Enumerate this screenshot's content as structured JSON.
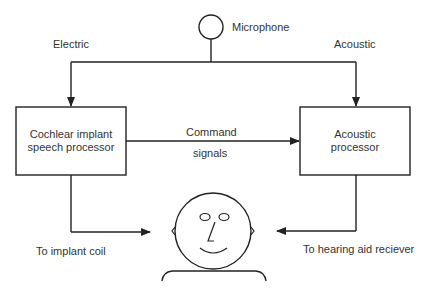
{
  "diagram": {
    "microphone": {
      "label": "Microphone"
    },
    "paths": {
      "electric_label": "Electric",
      "acoustic_label": "Acoustic",
      "command_label_line1": "Command",
      "command_label_line2": "signals"
    },
    "boxes": {
      "left": {
        "line1": "Cochlear implant",
        "line2": "speech processor"
      },
      "right": {
        "line1": "Acoustic",
        "line2": "processor"
      }
    },
    "outputs": {
      "left_label": "To implant coil",
      "right_label": "To hearing aid reciever"
    },
    "colors": {
      "stroke": "#222222",
      "text": "#333333",
      "background": "#ffffff"
    }
  }
}
